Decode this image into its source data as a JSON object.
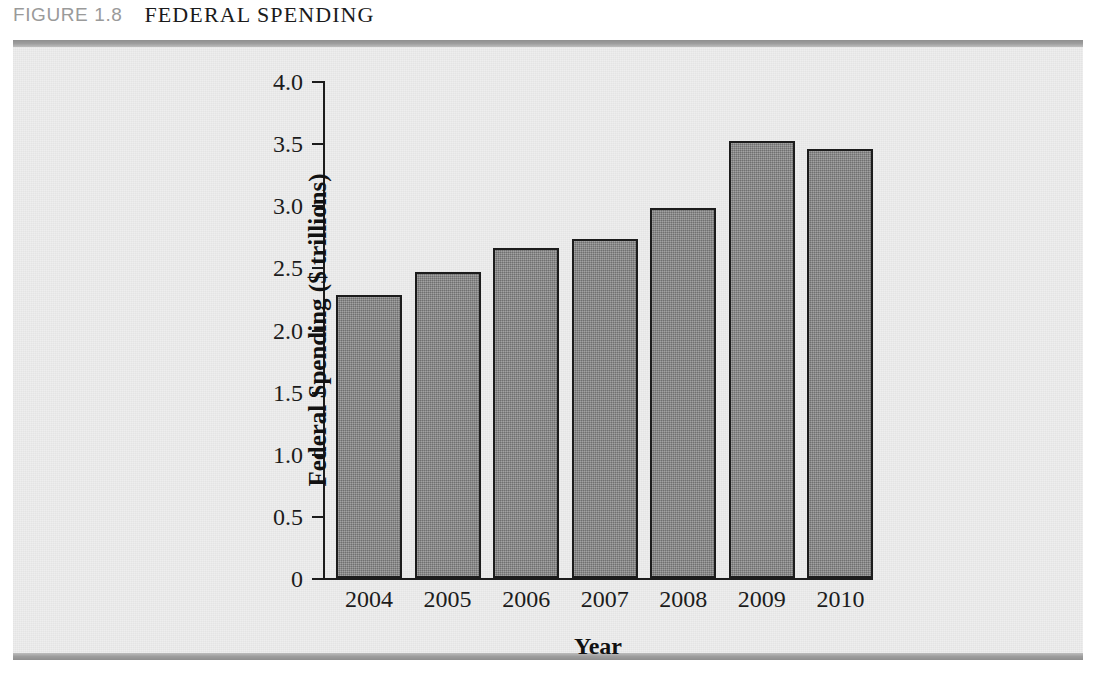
{
  "figure": {
    "label": "FIGURE 1.8",
    "title": "FEDERAL SPENDING"
  },
  "colors": {
    "bar_fill": "#8b8b8b",
    "bar_stroke": "#1c1c1c",
    "panel_background": "#eeeeee",
    "rule": "#9d9d9d",
    "caption_label": "#9a9a9a",
    "caption_title": "#1b1b1b"
  },
  "chart_data": {
    "type": "bar",
    "title": "FEDERAL SPENDING",
    "categories": [
      "2004",
      "2005",
      "2006",
      "2007",
      "2008",
      "2009",
      "2010"
    ],
    "values": [
      2.28,
      2.46,
      2.66,
      2.73,
      2.98,
      3.52,
      3.45
    ],
    "xlabel": "Year",
    "ylabel": "Federal Spending ($ trillions)",
    "ylim": [
      0,
      4.0
    ],
    "ytick_labels": [
      "0",
      "0.5",
      "1.0",
      "1.5",
      "2.0",
      "2.5",
      "3.0",
      "3.5",
      "4.0"
    ],
    "ytick_values": [
      0,
      0.5,
      1.0,
      1.5,
      2.0,
      2.5,
      3.0,
      3.5,
      4.0
    ],
    "grid": false,
    "legend": null
  }
}
